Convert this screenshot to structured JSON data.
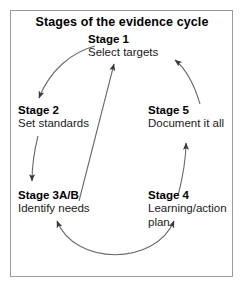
{
  "figure": {
    "title": "Stages of the evidence cycle",
    "width": 244,
    "height": 289,
    "background_color": "#ffffff",
    "border_color": "#9a9a9a",
    "line_color": "#555555",
    "text_color": "#000000"
  },
  "stages": [
    {
      "id": "stage1",
      "heading": "Stage 1",
      "detail": "Select targets",
      "position": "top-center"
    },
    {
      "id": "stage2",
      "heading": "Stage 2",
      "detail": "Set standards",
      "position": "middle-left"
    },
    {
      "id": "stage5",
      "heading": "Stage 5",
      "detail": "Document it all",
      "position": "middle-right"
    },
    {
      "id": "stage3",
      "heading": "Stage 3A/B",
      "detail": "Identify needs",
      "position": "bottom-left"
    },
    {
      "id": "stage4",
      "heading": "Stage 4",
      "detail": "Learning/action plan",
      "position": "bottom-right"
    }
  ],
  "connectors": [
    {
      "id": "stage1-to-stage2",
      "from": "stage1",
      "to": "stage2",
      "style": "curved",
      "heads": "end"
    },
    {
      "id": "stage2-to-stage3",
      "from": "stage2",
      "to": "stage3",
      "style": "curved",
      "heads": "end"
    },
    {
      "id": "stage3-to-stage4",
      "from": "stage3",
      "to": "stage4",
      "style": "arc",
      "heads": "both"
    },
    {
      "id": "stage4-to-stage5",
      "from": "stage4",
      "to": "stage5",
      "style": "curved",
      "heads": "end"
    },
    {
      "id": "stage5-to-stage1",
      "from": "stage5",
      "to": "stage1",
      "style": "curved",
      "heads": "end"
    },
    {
      "id": "stage3-to-stage1-center",
      "from": "stage3",
      "to": "stage1",
      "style": "straight",
      "heads": "end"
    }
  ]
}
